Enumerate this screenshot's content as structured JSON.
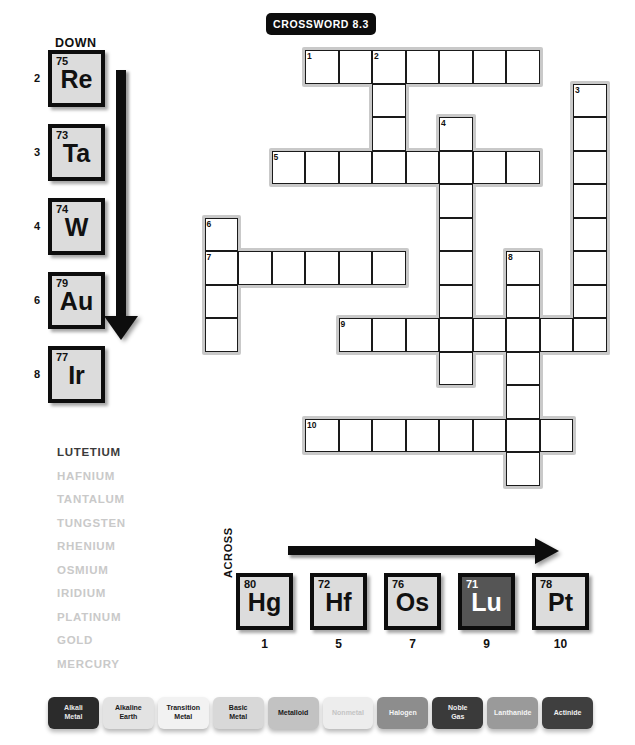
{
  "title": {
    "badge": "CROSSWORD 8.3"
  },
  "down": {
    "label": "DOWN",
    "arrow_icon": "down-arrow-icon",
    "tiles": [
      {
        "clue": "2",
        "number": "75",
        "symbol": "Re",
        "category": "transition-metal"
      },
      {
        "clue": "3",
        "number": "73",
        "symbol": "Ta",
        "category": "transition-metal"
      },
      {
        "clue": "4",
        "number": "74",
        "symbol": "W",
        "category": "transition-metal"
      },
      {
        "clue": "6",
        "number": "79",
        "symbol": "Au",
        "category": "transition-metal"
      },
      {
        "clue": "8",
        "number": "77",
        "symbol": "Ir",
        "category": "transition-metal"
      }
    ]
  },
  "across": {
    "label": "ACROSS",
    "arrow_icon": "right-arrow-icon",
    "tiles": [
      {
        "clue": "1",
        "number": "80",
        "symbol": "Hg",
        "category": "transition-metal"
      },
      {
        "clue": "5",
        "number": "72",
        "symbol": "Hf",
        "category": "transition-metal"
      },
      {
        "clue": "7",
        "number": "76",
        "symbol": "Os",
        "category": "transition-metal"
      },
      {
        "clue": "9",
        "number": "71",
        "symbol": "Lu",
        "category": "lanthanide"
      },
      {
        "clue": "10",
        "number": "78",
        "symbol": "Pt",
        "category": "transition-metal"
      }
    ]
  },
  "word_list": [
    {
      "name": "LUTETIUM",
      "solved": true
    },
    {
      "name": "HAFNIUM",
      "solved": false
    },
    {
      "name": "TANTALUM",
      "solved": false
    },
    {
      "name": "TUNGSTEN",
      "solved": false
    },
    {
      "name": "RHENIUM",
      "solved": false
    },
    {
      "name": "OSMIUM",
      "solved": false
    },
    {
      "name": "IRIDIUM",
      "solved": false
    },
    {
      "name": "PLATINUM",
      "solved": false
    },
    {
      "name": "GOLD",
      "solved": false
    },
    {
      "name": "MERCURY",
      "solved": false
    }
  ],
  "legend": [
    {
      "label": "Alkali Metal",
      "bg": "#2b2b2b",
      "fg": "#e8e8e8"
    },
    {
      "label": "Alkaline Earth",
      "bg": "#e3e3e3",
      "fg": "#1a1a1a"
    },
    {
      "label": "Transition Metal",
      "bg": "#f2f2f2",
      "fg": "#1a1a1a"
    },
    {
      "label": "Basic Metal",
      "bg": "#d8d8d8",
      "fg": "#1a1a1a"
    },
    {
      "label": "Metalloid",
      "bg": "#c2c2c2",
      "fg": "#1a1a1a"
    },
    {
      "label": "Nonmetal",
      "bg": "#ededed",
      "fg": "#c4c4c4"
    },
    {
      "label": "Halogen",
      "bg": "#8d8d8d",
      "fg": "#f5f5f5"
    },
    {
      "label": "Noble Gas",
      "bg": "#3a3a3a",
      "fg": "#f0f0f0"
    },
    {
      "label": "Lanthanide",
      "bg": "#9a9a9a",
      "fg": "#f5f5f5"
    },
    {
      "label": "Actinide",
      "bg": "#3f3f3f",
      "fg": "#f0f0f0"
    }
  ],
  "grid": {
    "cell": 33.5,
    "origin_x": 305,
    "origin_y": 50,
    "numbered_cells": [
      {
        "n": "1",
        "col": 0,
        "row": 0
      },
      {
        "n": "2",
        "col": 2,
        "row": 0
      },
      {
        "n": "3",
        "col": 8,
        "row": 1
      },
      {
        "n": "4",
        "col": 4,
        "row": 2
      },
      {
        "n": "5",
        "col": -1,
        "row": 3
      },
      {
        "n": "6",
        "col": -3,
        "row": 5
      },
      {
        "n": "7",
        "col": -3,
        "row": 6
      },
      {
        "n": "8",
        "col": 6,
        "row": 6
      },
      {
        "n": "9",
        "col": 1,
        "row": 8
      },
      {
        "n": "10",
        "col": 0,
        "row": 11
      }
    ],
    "words": [
      {
        "id": "a1",
        "dir": "across",
        "col": 0,
        "row": 0,
        "len": 7
      },
      {
        "id": "d2",
        "dir": "down",
        "col": 2,
        "row": 0,
        "len": 4
      },
      {
        "id": "d3",
        "dir": "down",
        "col": 8,
        "row": 1,
        "len": 8
      },
      {
        "id": "d4",
        "dir": "down",
        "col": 4,
        "row": 2,
        "len": 7
      },
      {
        "id": "a5",
        "dir": "across",
        "col": -1,
        "row": 3,
        "len": 8
      },
      {
        "id": "d6",
        "dir": "down",
        "col": -3,
        "row": 5,
        "len": 4
      },
      {
        "id": "a7",
        "dir": "across",
        "col": -3,
        "row": 6,
        "len": 6
      },
      {
        "id": "d8",
        "dir": "down",
        "col": 6,
        "row": 6,
        "len": 3
      },
      {
        "id": "a9",
        "dir": "across",
        "col": 1,
        "row": 8,
        "len": 8
      },
      {
        "id": "d9b",
        "dir": "down",
        "col": 4,
        "row": 8,
        "len": 2
      },
      {
        "id": "d10",
        "dir": "down",
        "col": 6,
        "row": 8,
        "len": 5
      },
      {
        "id": "a10",
        "dir": "across",
        "col": 0,
        "row": 11,
        "len": 8
      }
    ]
  }
}
